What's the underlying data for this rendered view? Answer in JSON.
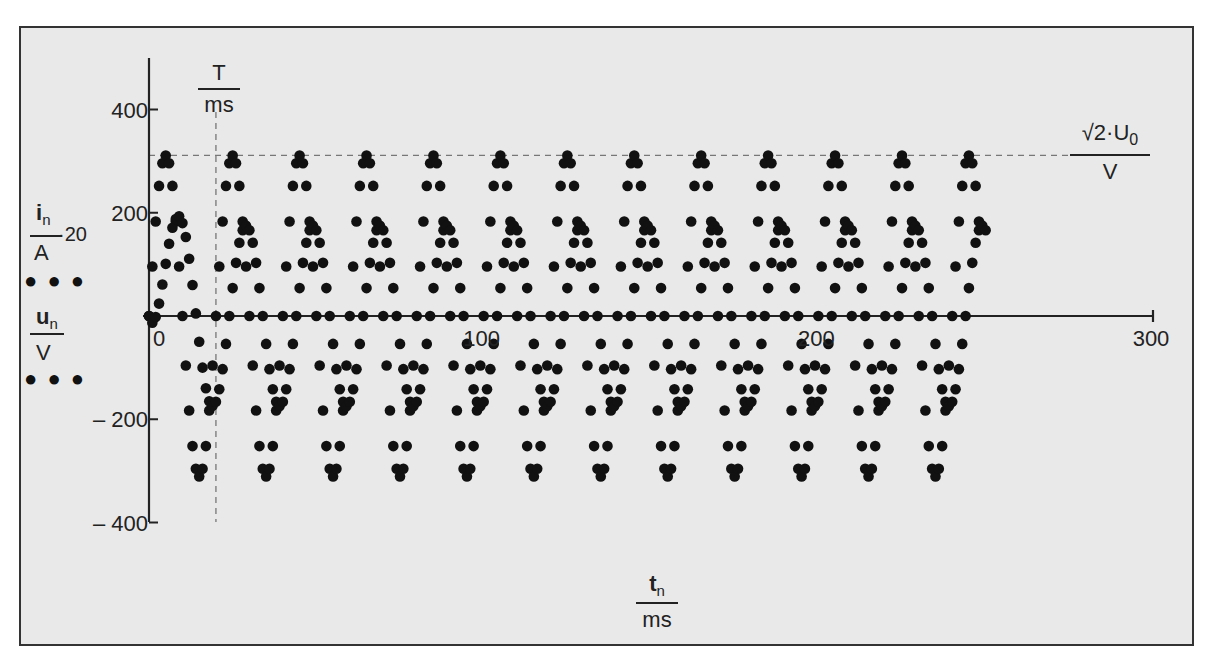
{
  "chart_data": {
    "type": "scatter",
    "title": "",
    "xlabel": {
      "numerator": "t",
      "numerator_sub": "n",
      "denominator": "ms"
    },
    "ylabel": [
      {
        "numerator": "i",
        "numerator_sub": "n",
        "denominator": "A",
        "factor": "·20",
        "marker": "● ● ●"
      },
      {
        "numerator": "u",
        "numerator_sub": "n",
        "denominator": "V",
        "marker": "● ● ●"
      }
    ],
    "xlim": [
      0,
      300
    ],
    "ylim": [
      -400,
      400
    ],
    "x_ticks": [
      0,
      100,
      200,
      300
    ],
    "y_ticks": [
      400,
      200,
      0,
      -200,
      -400
    ],
    "y_tick_labels": [
      "400",
      "200",
      "0",
      "– 200",
      "– 400"
    ],
    "annotations": {
      "period_line": {
        "x": 20,
        "label_numerator": "T",
        "label_denominator": "ms",
        "style": "dashed"
      },
      "peak_line": {
        "y": 311,
        "label_numerator": "√2·U",
        "label_sub": "0",
        "label_denominator": "V",
        "style": "dashed"
      }
    },
    "series": [
      {
        "name": "u_n / V",
        "t_start": 0,
        "t_step": 1,
        "values": [
          0,
          96,
          183,
          252,
          296,
          311,
          296,
          252,
          183,
          96,
          0,
          -96,
          -183,
          -252,
          -296,
          -311,
          -296,
          -252,
          -183,
          -96,
          0,
          96,
          183,
          252,
          296,
          311,
          296,
          252,
          183,
          96,
          0,
          -96,
          -183,
          -252,
          -296,
          -311,
          -296,
          -252,
          -183,
          -96,
          0,
          96,
          183,
          252,
          296,
          311,
          296,
          252,
          183,
          96,
          0,
          -96,
          -183,
          -252,
          -296,
          -311,
          -296,
          -252,
          -183,
          -96,
          0,
          96,
          183,
          252,
          296,
          311,
          296,
          252,
          183,
          96,
          0,
          -96,
          -183,
          -252,
          -296,
          -311,
          -296,
          -252,
          -183,
          -96,
          0,
          96,
          183,
          252,
          296,
          311,
          296,
          252,
          183,
          96,
          0,
          -96,
          -183,
          -252,
          -296,
          -311,
          -296,
          -252,
          -183,
          -96,
          0,
          96,
          183,
          252,
          296,
          311,
          296,
          252,
          183,
          96,
          0,
          -96,
          -183,
          -252,
          -296,
          -311,
          -296,
          -252,
          -183,
          -96,
          0,
          96,
          183,
          252,
          296,
          311,
          296,
          252,
          183,
          96,
          0,
          -96,
          -183,
          -252,
          -296,
          -311,
          -296,
          -252,
          -183,
          -96,
          0,
          96,
          183,
          252,
          296,
          311,
          296,
          252,
          183,
          96,
          0,
          -96,
          -183,
          -252,
          -296,
          -311,
          -296,
          -252,
          -183,
          -96,
          0,
          96,
          183,
          252,
          296,
          311,
          296,
          252,
          183,
          96,
          0,
          -96,
          -183,
          -252,
          -296,
          -311,
          -296,
          -252,
          -183,
          -96,
          0,
          96,
          183,
          252,
          296,
          311,
          296,
          252,
          183,
          96,
          0,
          -96,
          -183,
          -252,
          -296,
          -311,
          -296,
          -252,
          -183,
          -96,
          0,
          96,
          183,
          252,
          296,
          311,
          296,
          252,
          183,
          96,
          0,
          -96,
          -183,
          -252,
          -296,
          -311,
          -296,
          -252,
          -183,
          -96,
          0,
          96,
          183,
          252,
          296,
          311,
          296,
          252,
          183,
          96,
          0,
          -96,
          -183,
          -252,
          -296,
          -311,
          -296,
          -252,
          -183,
          -96,
          0,
          96,
          183,
          252,
          296,
          311,
          296,
          252,
          183
        ]
      },
      {
        "name": "i_n / A · 20",
        "t_start": 0,
        "t_step": 1,
        "values": [
          0,
          -13,
          -2,
          24,
          61,
          101,
          140,
          171,
          188,
          193,
          180,
          153,
          111,
          60,
          5,
          -50,
          -100,
          -140,
          -165,
          -174,
          -166,
          -142,
          -103,
          -54,
          0,
          54,
          103,
          142,
          166,
          175,
          166,
          142,
          103,
          54,
          0,
          -54,
          -103,
          -142,
          -166,
          -175,
          -166,
          -142,
          -103,
          -54,
          0,
          54,
          103,
          142,
          166,
          175,
          166,
          142,
          103,
          54,
          0,
          -54,
          -103,
          -142,
          -166,
          -175,
          -166,
          -142,
          -103,
          -54,
          0,
          54,
          103,
          142,
          166,
          175,
          166,
          142,
          103,
          54,
          0,
          -54,
          -103,
          -142,
          -166,
          -175,
          -166,
          -142,
          -103,
          -54,
          0,
          54,
          103,
          142,
          166,
          175,
          166,
          142,
          103,
          54,
          0,
          -54,
          -103,
          -142,
          -166,
          -175,
          -166,
          -142,
          -103,
          -54,
          0,
          54,
          103,
          142,
          166,
          175,
          166,
          142,
          103,
          54,
          0,
          -54,
          -103,
          -142,
          -166,
          -175,
          -166,
          -142,
          -103,
          -54,
          0,
          54,
          103,
          142,
          166,
          175,
          166,
          142,
          103,
          54,
          0,
          -54,
          -103,
          -142,
          -166,
          -175,
          -166,
          -142,
          -103,
          -54,
          0,
          54,
          103,
          142,
          166,
          175,
          166,
          142,
          103,
          54,
          0,
          -54,
          -103,
          -142,
          -166,
          -175,
          -166,
          -142,
          -103,
          -54,
          0,
          54,
          103,
          142,
          166,
          175,
          166,
          142,
          103,
          54,
          0,
          -54,
          -103,
          -142,
          -166,
          -175,
          -166,
          -142,
          -103,
          -54,
          0,
          54,
          103,
          142,
          166,
          175,
          166,
          142,
          103,
          54,
          0,
          -54,
          -103,
          -142,
          -166,
          -175,
          -166,
          -142,
          -103,
          -54,
          0,
          54,
          103,
          142,
          166,
          175,
          166,
          142,
          103,
          54,
          0,
          -54,
          -103,
          -142,
          -166,
          -175,
          -166,
          -142,
          -103,
          -54,
          0,
          54,
          103,
          142,
          166,
          175,
          166,
          142,
          103,
          54,
          0,
          -54,
          -103,
          -142,
          -166,
          -175,
          -166,
          -142,
          -103,
          -54,
          0,
          54,
          103,
          142,
          166,
          175,
          166
        ]
      }
    ],
    "grid": false,
    "legend": "left of plot, stacked fraction labels with dot markers",
    "colors": {
      "background": "#e9e9e9",
      "frame": "#333333",
      "points": "#111111",
      "axis": "#222222",
      "dashed": "#777777"
    }
  }
}
